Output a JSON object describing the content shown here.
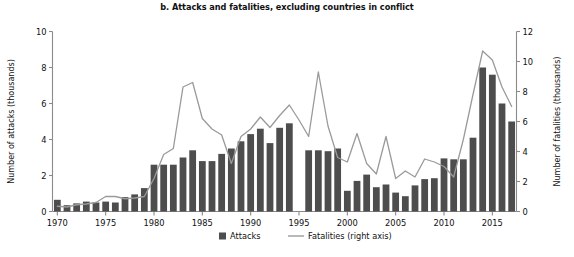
{
  "chart_data": {
    "type": "bar",
    "title": "b. Attacks and fatalities, excluding countries in conflict",
    "xlabel": "",
    "ylabel": "Number of attacks (thousands)",
    "y2label": "Number of fatalities (thousands)",
    "ylim": [
      0,
      10
    ],
    "y2lim": [
      0,
      12
    ],
    "ytick_labels": [
      "0",
      "2",
      "4",
      "6",
      "8",
      "10"
    ],
    "ytick_values": [
      0,
      2,
      4,
      6,
      8,
      10
    ],
    "y2tick_labels": [
      "0",
      "2",
      "4",
      "6",
      "8",
      "10",
      "12"
    ],
    "y2tick_values": [
      0,
      2,
      4,
      6,
      8,
      10,
      12
    ],
    "xtick_labels": [
      "1970",
      "1975",
      "1980",
      "1985",
      "1990",
      "1995",
      "2000",
      "2005",
      "2010",
      "2015"
    ],
    "xtick_values": [
      1970,
      1975,
      1980,
      1985,
      1990,
      1995,
      2000,
      2005,
      2010,
      2015
    ],
    "grid": false,
    "legend_position": "bottom-center",
    "categories": [
      1970,
      1971,
      1972,
      1973,
      1974,
      1975,
      1976,
      1977,
      1978,
      1979,
      1980,
      1981,
      1982,
      1983,
      1984,
      1985,
      1986,
      1987,
      1988,
      1989,
      1990,
      1991,
      1992,
      1993,
      1994,
      1995,
      1996,
      1997,
      1998,
      1999,
      2000,
      2001,
      2002,
      2003,
      2004,
      2005,
      2006,
      2007,
      2008,
      2009,
      2010,
      2011,
      2012,
      2013,
      2014,
      2015,
      2016,
      2017
    ],
    "series": [
      {
        "name": "Attacks",
        "axis": "left",
        "units": "thousands",
        "type": "bar",
        "values": [
          0.65,
          0.35,
          0.45,
          0.55,
          0.5,
          0.55,
          0.5,
          0.8,
          0.95,
          1.3,
          2.6,
          2.6,
          2.6,
          3.0,
          3.4,
          2.8,
          2.8,
          3.2,
          3.5,
          3.9,
          4.3,
          4.6,
          3.8,
          4.65,
          4.9,
          0.0,
          3.4,
          3.4,
          3.35,
          3.5,
          1.15,
          1.7,
          2.05,
          1.35,
          1.5,
          1.05,
          0.85,
          1.45,
          1.8,
          1.85,
          2.95,
          2.9,
          2.9,
          4.1,
          8.0,
          7.6,
          6.0,
          5.0
        ]
      },
      {
        "name": "Fatalities (right axis)",
        "axis": "right",
        "units": "thousands",
        "type": "line",
        "values": [
          0.35,
          0.3,
          0.45,
          0.5,
          0.6,
          1.0,
          1.0,
          0.85,
          0.9,
          1.0,
          2.2,
          3.8,
          4.2,
          8.3,
          8.6,
          6.2,
          5.5,
          5.1,
          3.2,
          5.0,
          5.5,
          6.3,
          5.6,
          6.4,
          7.1,
          6.1,
          5.0,
          9.3,
          5.7,
          3.6,
          3.3,
          5.2,
          3.2,
          2.5,
          5.0,
          2.2,
          2.7,
          2.3,
          3.5,
          3.3,
          3.0,
          2.3,
          4.8,
          7.8,
          10.7,
          10.1,
          8.3,
          7.0
        ]
      }
    ],
    "legend": [
      {
        "label": "Attacks",
        "marker": "bar",
        "color": "#4d4d4d"
      },
      {
        "label": "Fatalities (right axis)",
        "marker": "line",
        "color": "#9a9a9a"
      }
    ],
    "colors": {
      "bar": "#4d4d4d",
      "line": "#9a9a9a",
      "axis": "#8a8a8a",
      "text": "#111111",
      "background": "#ffffff"
    }
  }
}
